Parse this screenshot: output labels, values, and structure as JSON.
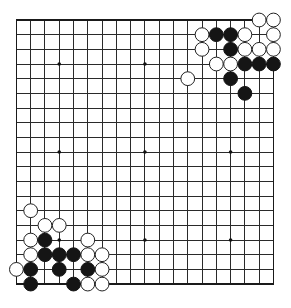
{
  "board": {
    "size": 19,
    "origin": {
      "x": 16.4,
      "y": 20
    },
    "spacing": {
      "x": 14.28,
      "y": 14.67
    },
    "stone_radius": 6.9,
    "colors": {
      "background": "#ffffff",
      "line": "#2a2a2a",
      "black_stone": "#151515",
      "white_stone": "#ffffff"
    },
    "star_points": [
      [
        3,
        3
      ],
      [
        9,
        3
      ],
      [
        15,
        3
      ],
      [
        3,
        9
      ],
      [
        9,
        9
      ],
      [
        15,
        9
      ],
      [
        3,
        15
      ],
      [
        9,
        15
      ],
      [
        15,
        15
      ]
    ],
    "stones": {
      "black": [
        [
          14,
          1
        ],
        [
          15,
          1
        ],
        [
          15,
          2
        ],
        [
          16,
          3
        ],
        [
          17,
          3
        ],
        [
          18,
          3
        ],
        [
          15,
          4
        ],
        [
          16,
          5
        ],
        [
          2,
          15
        ],
        [
          2,
          16
        ],
        [
          3,
          16
        ],
        [
          4,
          16
        ],
        [
          1,
          17
        ],
        [
          3,
          17
        ],
        [
          5,
          17
        ],
        [
          1,
          18
        ],
        [
          4,
          18
        ]
      ],
      "white": [
        [
          17,
          0
        ],
        [
          18,
          0
        ],
        [
          13,
          1
        ],
        [
          16,
          1
        ],
        [
          18,
          1
        ],
        [
          13,
          2
        ],
        [
          16,
          2
        ],
        [
          17,
          2
        ],
        [
          18,
          2
        ],
        [
          14,
          3
        ],
        [
          15,
          3
        ],
        [
          12,
          4
        ],
        [
          1,
          13
        ],
        [
          2,
          14
        ],
        [
          3,
          14
        ],
        [
          1,
          15
        ],
        [
          5,
          15
        ],
        [
          1,
          16
        ],
        [
          5,
          16
        ],
        [
          6,
          16
        ],
        [
          0,
          17
        ],
        [
          6,
          17
        ],
        [
          5,
          18
        ],
        [
          6,
          18
        ]
      ]
    }
  }
}
